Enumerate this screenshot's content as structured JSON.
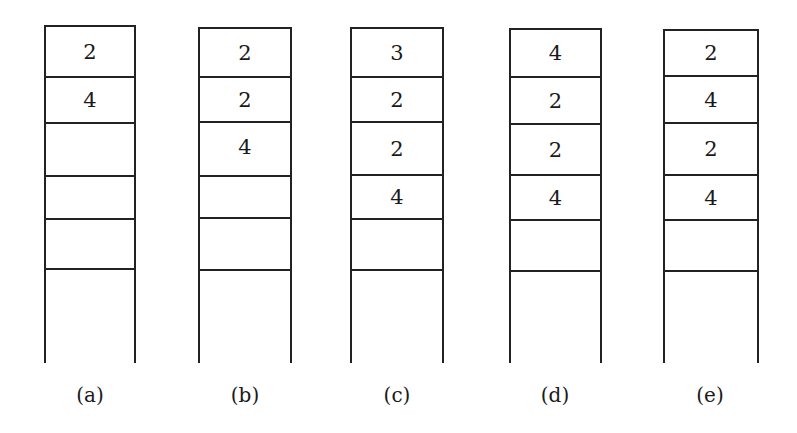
{
  "diagram": {
    "columns": [
      {
        "label": "(a)",
        "cells": [
          "2",
          "4",
          "",
          "",
          ""
        ]
      },
      {
        "label": "(b)",
        "cells": [
          "2",
          "2",
          "4",
          "",
          ""
        ]
      },
      {
        "label": "(c)",
        "cells": [
          "3",
          "2",
          "2",
          "4",
          ""
        ]
      },
      {
        "label": "(d)",
        "cells": [
          "4",
          "2",
          "2",
          "4",
          ""
        ]
      },
      {
        "label": "(e)",
        "cells": [
          "2",
          "4",
          "2",
          "4",
          ""
        ]
      }
    ]
  }
}
